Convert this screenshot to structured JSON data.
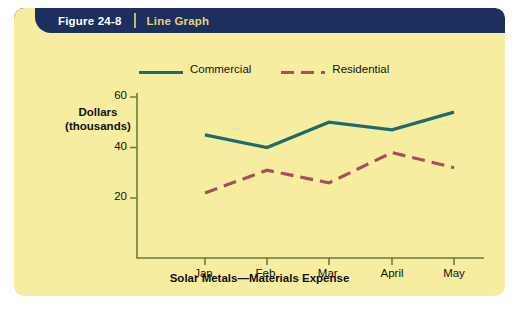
{
  "figure": {
    "number": "Figure 24-8",
    "kind": "Line Graph"
  },
  "colors": {
    "card_background": "#f7eda0",
    "banner": "#1c2f5e",
    "banner_number_text": "#ffffff",
    "banner_kind_text": "#e4d47a",
    "commercial_line": "#1d6b6b",
    "residential_line": "#a6505c",
    "axis": "#6e7a3c",
    "text": "#111111"
  },
  "chart_data": {
    "type": "line",
    "title": "Solar Metals—Materials Expense",
    "xlabel": "Solar Metals—Materials Expense",
    "ylabel": "Dollars (thousands)",
    "ylabel_lines": [
      "Dollars",
      "(thousands)"
    ],
    "categories": [
      "Jan.",
      "Feb.",
      "Mar.",
      "April",
      "May"
    ],
    "yticks": [
      20,
      40,
      60
    ],
    "ylim": [
      0,
      68
    ],
    "grid": false,
    "legend_position": "top",
    "series": [
      {
        "name": "Commercial",
        "style": "solid",
        "color": "#1d6b6b",
        "values": [
          45,
          40,
          50,
          47,
          54
        ]
      },
      {
        "name": "Residential",
        "style": "dashed",
        "color": "#a6505c",
        "values": [
          22,
          31,
          26,
          38,
          32
        ]
      }
    ]
  }
}
